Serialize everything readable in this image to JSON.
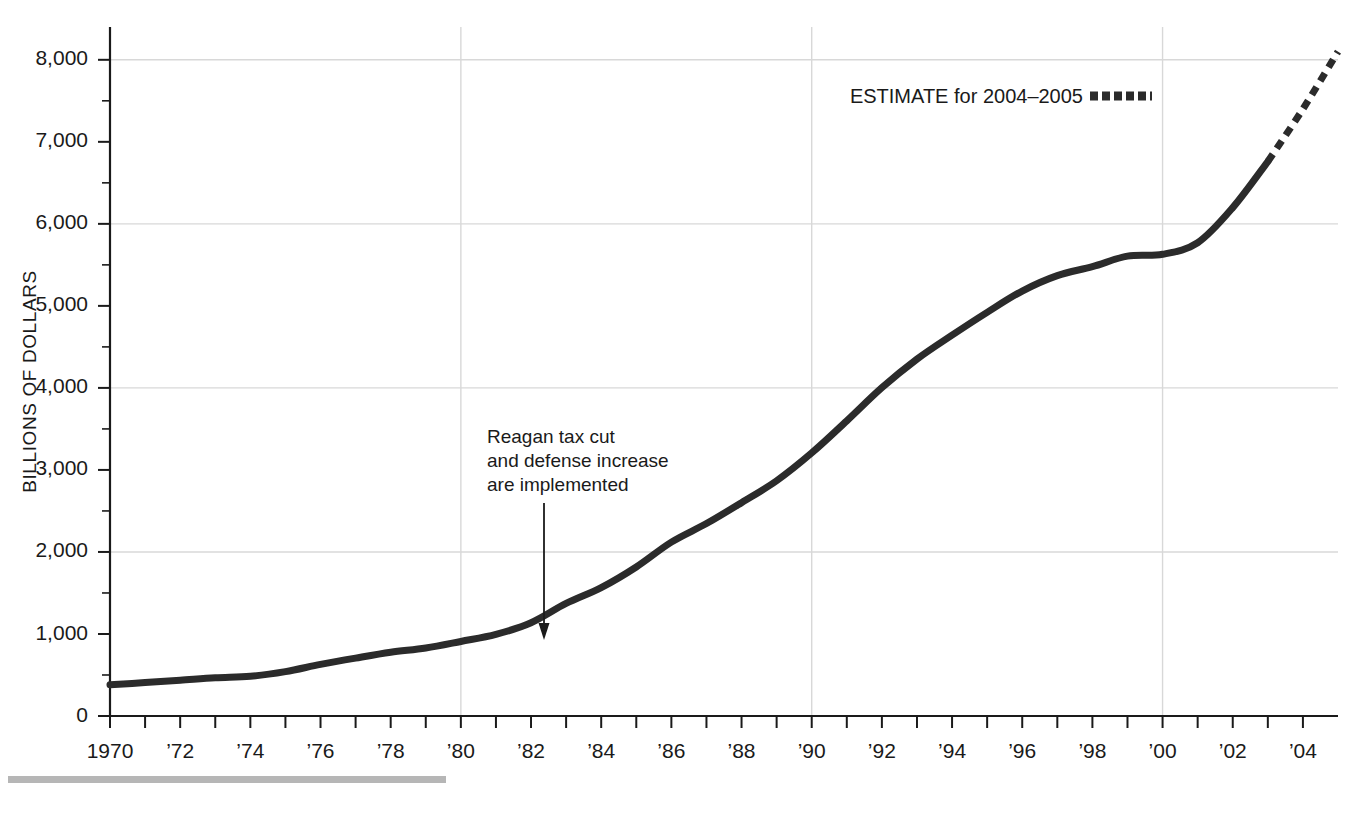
{
  "chart_data": {
    "type": "line",
    "title": "",
    "xlabel": "",
    "ylabel": "BILLIONS OF DOLLARS",
    "xlim": [
      1970,
      2005
    ],
    "ylim": [
      0,
      8400
    ],
    "yticks": [
      0,
      1000,
      2000,
      3000,
      4000,
      5000,
      6000,
      7000,
      8000
    ],
    "ytick_labels": [
      "0",
      "1,000",
      "2,000",
      "3,000",
      "4,000",
      "5,000",
      "6,000",
      "7,000",
      "8,000"
    ],
    "yminor_step": 500,
    "xticks": [
      1970,
      1971,
      1972,
      1973,
      1974,
      1975,
      1976,
      1977,
      1978,
      1979,
      1980,
      1981,
      1982,
      1983,
      1984,
      1985,
      1986,
      1987,
      1988,
      1989,
      1990,
      1991,
      1992,
      1993,
      1994,
      1995,
      1996,
      1997,
      1998,
      1999,
      2000,
      2001,
      2002,
      2003,
      2004
    ],
    "xtick_labels": [
      {
        "x": 1970,
        "label": "1970"
      },
      {
        "x": 1972,
        "label": "’72"
      },
      {
        "x": 1974,
        "label": "’74"
      },
      {
        "x": 1976,
        "label": "’76"
      },
      {
        "x": 1978,
        "label": "’78"
      },
      {
        "x": 1980,
        "label": "’80"
      },
      {
        "x": 1982,
        "label": "’82"
      },
      {
        "x": 1984,
        "label": "’84"
      },
      {
        "x": 1986,
        "label": "’86"
      },
      {
        "x": 1988,
        "label": "’88"
      },
      {
        "x": 1990,
        "label": "’90"
      },
      {
        "x": 1992,
        "label": "’92"
      },
      {
        "x": 1994,
        "label": "’94"
      },
      {
        "x": 1996,
        "label": "’96"
      },
      {
        "x": 1998,
        "label": "’98"
      },
      {
        "x": 2000,
        "label": "’00"
      },
      {
        "x": 2002,
        "label": "’02"
      },
      {
        "x": 2004,
        "label": "’04"
      }
    ],
    "grid": {
      "horizontal_at": [
        2000,
        4000,
        6000,
        8000
      ],
      "vertical_at": [
        1980,
        1990,
        2000
      ]
    },
    "line_color": "#2b2b2b",
    "series": [
      {
        "name": "Actual",
        "style": "solid",
        "x": [
          1970,
          1971,
          1972,
          1973,
          1974,
          1975,
          1976,
          1977,
          1978,
          1979,
          1980,
          1981,
          1982,
          1983,
          1984,
          1985,
          1986,
          1987,
          1988,
          1989,
          1990,
          1991,
          1992,
          1993,
          1994,
          1995,
          1996,
          1997,
          1998,
          1999,
          2000,
          2001,
          2002,
          2003
        ],
        "values": [
          380,
          408,
          436,
          466,
          484,
          541,
          629,
          706,
          777,
          829,
          909,
          995,
          1137,
          1372,
          1565,
          1817,
          2120,
          2346,
          2601,
          2868,
          3207,
          3598,
          4002,
          4351,
          4643,
          4921,
          5181,
          5369,
          5478,
          5606,
          5629,
          5770,
          6198,
          6760
        ]
      },
      {
        "name": "ESTIMATE for 2004–2005",
        "style": "dashed",
        "x": [
          2003,
          2004,
          2005
        ],
        "values": [
          6760,
          7400,
          8100
        ]
      }
    ],
    "legend": {
      "position": "top-right",
      "entries": [
        {
          "label": "ESTIMATE for 2004–2005",
          "style": "dashed",
          "color": "#2b2b2b"
        }
      ]
    },
    "annotations": [
      {
        "text_lines": [
          "Reagan tax cut",
          "and defense increase",
          "are implemented"
        ],
        "points_to_x": 1982,
        "points_to_y": 1050,
        "arrow": true
      }
    ]
  },
  "legend": {
    "estimate_label": "ESTIMATE for 2004–2005"
  },
  "annotation": {
    "line1": "Reagan tax cut",
    "line2": "and defense increase",
    "line3": "are implemented"
  },
  "axis": {
    "y_title": "BILLIONS OF DOLLARS"
  },
  "ytick_labels": {
    "t0": "0",
    "t1": "1,000",
    "t2": "2,000",
    "t3": "3,000",
    "t4": "4,000",
    "t5": "5,000",
    "t6": "6,000",
    "t7": "7,000",
    "t8": "8,000"
  },
  "xtick_labels": {
    "x1970": "1970",
    "x1972": "’72",
    "x1974": "’74",
    "x1976": "’76",
    "x1978": "’78",
    "x1980": "’80",
    "x1982": "’82",
    "x1984": "’84",
    "x1986": "’86",
    "x1988": "’88",
    "x1990": "’90",
    "x1992": "’92",
    "x1994": "’94",
    "x1996": "’96",
    "x1998": "’98",
    "x2000": "’00",
    "x2002": "’02",
    "x2004": "’04"
  },
  "colors": {
    "line": "#2b2b2b",
    "grid": "#d8d8d8",
    "axis": "#1a1a1a",
    "footer_rule": "#b6b6b6"
  }
}
